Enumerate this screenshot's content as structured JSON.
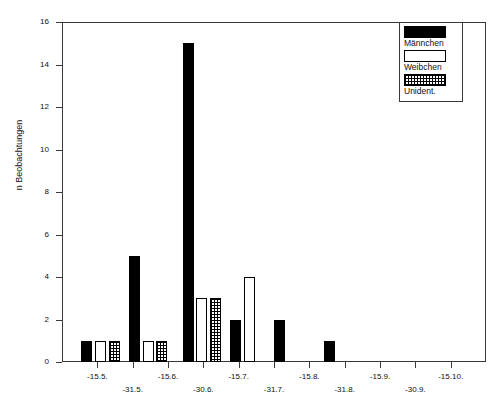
{
  "chart_data": {
    "type": "bar",
    "title": "",
    "xlabel": "",
    "ylabel": "n Beobachtungen",
    "ylim": [
      0,
      16
    ],
    "ytick_values": [
      0,
      2,
      4,
      6,
      8,
      10,
      12,
      14,
      16
    ],
    "ytick_labels": [
      "0",
      "2",
      "4",
      "6",
      "8",
      "10",
      "12",
      "14",
      "16"
    ],
    "grid": false,
    "legend_position": "top-right",
    "xtick_labels": [
      "-15.5.",
      "-31.5.",
      "-15.6.",
      "-30.6.",
      "-15.7.",
      "-31.7.",
      "-15.8.",
      "-31.8.",
      "-15.9.",
      "-30.9.",
      "-15.10."
    ],
    "series": [
      {
        "name": "Männchen",
        "fill": "solid-black",
        "color": "#000000"
      },
      {
        "name": "Weibchen",
        "fill": "white",
        "color": "#ffffff"
      },
      {
        "name": "Unident.",
        "fill": "hatched",
        "color": "#000000"
      }
    ],
    "bars": [
      {
        "series": "Männchen",
        "value": 1,
        "x_frac": 0.045
      },
      {
        "series": "Weibchen",
        "value": 1,
        "x_frac": 0.078
      },
      {
        "series": "Unident.",
        "value": 1,
        "x_frac": 0.11
      },
      {
        "series": "Männchen",
        "value": 5,
        "x_frac": 0.158
      },
      {
        "series": "Weibchen",
        "value": 1,
        "x_frac": 0.19
      },
      {
        "series": "Unident.",
        "value": 1,
        "x_frac": 0.222
      },
      {
        "series": "Männchen",
        "value": 15,
        "x_frac": 0.285
      },
      {
        "series": "Weibchen",
        "value": 3,
        "x_frac": 0.317
      },
      {
        "series": "Unident.",
        "value": 3,
        "x_frac": 0.349
      },
      {
        "series": "Männchen",
        "value": 2,
        "x_frac": 0.397
      },
      {
        "series": "Weibchen",
        "value": 4,
        "x_frac": 0.429
      },
      {
        "series": "Männchen",
        "value": 2,
        "x_frac": 0.5
      },
      {
        "series": "Männchen",
        "value": 1,
        "x_frac": 0.618
      }
    ]
  },
  "legend": {
    "entries": [
      {
        "label": "Männchen",
        "swatch": "solid-black-swatch"
      },
      {
        "label": "Weibchen",
        "swatch": "white-swatch"
      },
      {
        "label": "Unident.",
        "swatch": "hatched-swatch"
      }
    ]
  }
}
